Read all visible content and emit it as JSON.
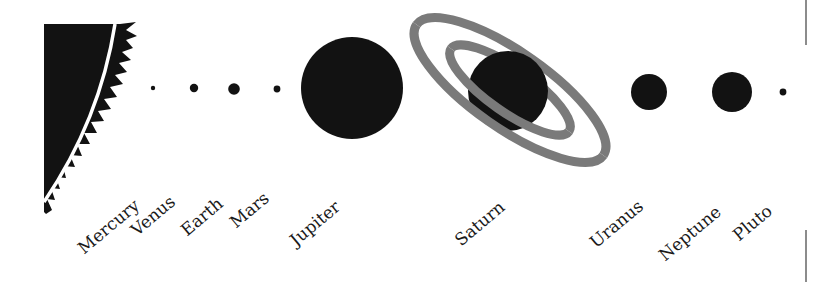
{
  "diagram": {
    "colors": {
      "body": "#121212",
      "ring": "#7a7a7a",
      "divider": "#666666",
      "background": "#ffffff"
    },
    "sun": {
      "name": "Sun"
    },
    "planets": [
      {
        "name": "Mercury",
        "cx": 153,
        "cy": 88,
        "r": 2.2,
        "label_x": 86,
        "label_y": 240
      },
      {
        "name": "Venus",
        "cx": 194,
        "cy": 88,
        "r": 4.2,
        "label_x": 139,
        "label_y": 222
      },
      {
        "name": "Earth",
        "cx": 234,
        "cy": 89,
        "r": 5.8,
        "label_x": 189,
        "label_y": 222
      },
      {
        "name": "Mars",
        "cx": 277,
        "cy": 89,
        "r": 3.4,
        "label_x": 238,
        "label_y": 214
      },
      {
        "name": "Jupiter",
        "cx": 352,
        "cy": 88,
        "r": 51,
        "label_x": 298,
        "label_y": 232
      },
      {
        "name": "Saturn",
        "cx": 508,
        "cy": 91,
        "r": 40,
        "label_x": 463,
        "label_y": 232
      },
      {
        "name": "Uranus",
        "cx": 649,
        "cy": 92,
        "r": 18,
        "label_x": 598,
        "label_y": 234
      },
      {
        "name": "Neptune",
        "cx": 732,
        "cy": 92,
        "r": 20,
        "label_x": 667,
        "label_y": 247
      },
      {
        "name": "Pluto",
        "cx": 783,
        "cy": 92,
        "r": 3.4,
        "label_x": 741,
        "label_y": 227
      }
    ],
    "labels": {
      "mercury": "Mercury",
      "venus": "Venus",
      "earth": "Earth",
      "mars": "Mars",
      "jupiter": "Jupiter",
      "saturn": "Saturn",
      "uranus": "Uranus",
      "neptune": "Neptune",
      "pluto": "Pluto"
    }
  }
}
